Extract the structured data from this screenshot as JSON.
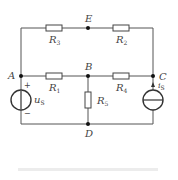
{
  "diagram": {
    "type": "circuit",
    "nodes": {
      "A": "A",
      "B": "B",
      "C": "C",
      "D": "D",
      "E": "E"
    },
    "resistors": [
      {
        "id": "R3",
        "name": "R",
        "sub": "3",
        "between": [
          "A",
          "E"
        ]
      },
      {
        "id": "R2",
        "name": "R",
        "sub": "2",
        "between": [
          "E",
          "C"
        ]
      },
      {
        "id": "R1",
        "name": "R",
        "sub": "1",
        "between": [
          "A",
          "B"
        ]
      },
      {
        "id": "R4",
        "name": "R",
        "sub": "4",
        "between": [
          "B",
          "C"
        ]
      },
      {
        "id": "R5",
        "name": "R",
        "sub": "5",
        "between": [
          "B",
          "D"
        ]
      }
    ],
    "sources": {
      "voltage": {
        "name": "u",
        "sub": "S",
        "plus": "+",
        "minus": "−",
        "between": [
          "A",
          "D"
        ]
      },
      "current": {
        "name": "i",
        "sub": "S",
        "between": [
          "D",
          "C"
        ],
        "direction": "up"
      }
    },
    "caption": ""
  },
  "colors": {
    "wire": "#555555",
    "node": "#111111",
    "label": "#444444"
  }
}
